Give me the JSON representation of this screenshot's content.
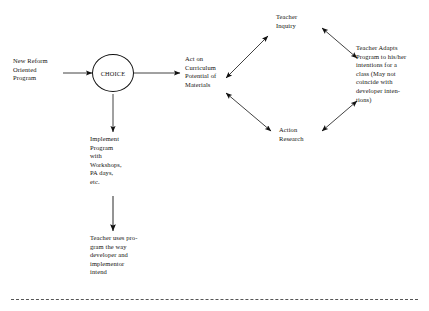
{
  "diagram": {
    "nodes": {
      "new_reform_program": "New Reform\nOriented\nProgram",
      "choice": "CHOICE",
      "act_on_curriculum": "Act on\nCurriculum\nPotential of\nMaterials",
      "teacher_inquiry": "Teacher\nInquiry",
      "action_research": "Action\nResearch",
      "teacher_adapts": "Teacher Adapts\nProgram to his/her\nintentions for a\nclass (May not\ncoincide with\ndeveloper inten-\ntions)",
      "implement_program": "Implement\nProgram\nwith\nWorkshops,\nPA days,\netc.",
      "teacher_uses_program": "Teacher uses pro-\ngram the way\ndeveloper and\nimplementor\nintend"
    },
    "edges": [
      {
        "name": "program-to-choice",
        "from": "new_reform_program",
        "to": "choice",
        "style": "single-arrow"
      },
      {
        "name": "choice-to-act-on-curriculum",
        "from": "choice",
        "to": "act_on_curriculum",
        "style": "single-arrow"
      },
      {
        "name": "choice-to-implement",
        "from": "choice",
        "to": "implement_program",
        "style": "single-arrow"
      },
      {
        "name": "implement-to-teacher-uses",
        "from": "implement_program",
        "to": "teacher_uses_program",
        "style": "single-arrow"
      },
      {
        "name": "act-to-teacher-inquiry",
        "from": "act_on_curriculum",
        "to": "teacher_inquiry",
        "style": "double-arrow"
      },
      {
        "name": "act-to-action-research",
        "from": "act_on_curriculum",
        "to": "action_research",
        "style": "double-arrow"
      },
      {
        "name": "teacher-inquiry-to-teacher-adapts",
        "from": "teacher_inquiry",
        "to": "teacher_adapts",
        "style": "double-arrow"
      },
      {
        "name": "action-research-to-teacher-adapts",
        "from": "action_research",
        "to": "teacher_adapts",
        "style": "double-arrow"
      }
    ],
    "colors": {
      "stroke": "#111111",
      "text": "#14120f",
      "background": "#ffffff",
      "rule": "#555555"
    }
  }
}
